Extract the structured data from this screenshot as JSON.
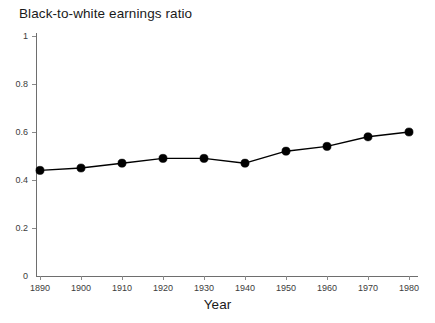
{
  "chart_data": {
    "type": "line",
    "title": "Black-to-white earnings ratio",
    "xlabel": "Year",
    "ylabel": "",
    "x": [
      1890,
      1900,
      1910,
      1920,
      1930,
      1940,
      1950,
      1960,
      1970,
      1980
    ],
    "values": [
      0.44,
      0.45,
      0.47,
      0.49,
      0.49,
      0.47,
      0.52,
      0.54,
      0.58,
      0.6
    ],
    "xlim": [
      1890,
      1980
    ],
    "ylim": [
      0,
      1
    ],
    "x_tick_labels": [
      "1890",
      "1900",
      "1910",
      "1920",
      "1930",
      "1940",
      "1950",
      "1960",
      "1970",
      "1980"
    ],
    "y_ticks": [
      0,
      0.2,
      0.4,
      0.6,
      0.8,
      1
    ],
    "y_tick_labels": [
      "0",
      "0.2",
      "0.4",
      "0.6",
      "0.8",
      "1"
    ],
    "grid": false,
    "legend": null,
    "series_color": "#000000",
    "marker": "circle"
  }
}
